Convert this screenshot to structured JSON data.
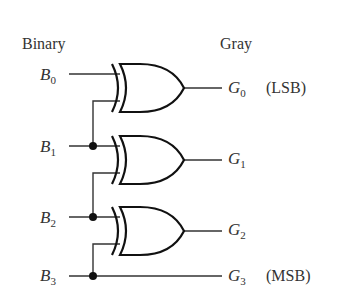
{
  "diagram": {
    "type": "binary-to-gray-code-converter",
    "headers": {
      "left": "Binary",
      "right": "Gray"
    },
    "inputs": [
      {
        "letter": "B",
        "sub": "0"
      },
      {
        "letter": "B",
        "sub": "1"
      },
      {
        "letter": "B",
        "sub": "2"
      },
      {
        "letter": "B",
        "sub": "3"
      }
    ],
    "outputs": [
      {
        "letter": "G",
        "sub": "0",
        "note": "(LSB)"
      },
      {
        "letter": "G",
        "sub": "1",
        "note": ""
      },
      {
        "letter": "G",
        "sub": "2",
        "note": ""
      },
      {
        "letter": "G",
        "sub": "3",
        "note": "(MSB)"
      }
    ],
    "gates": [
      {
        "type": "XOR",
        "inputs": [
          "B0",
          "B1"
        ],
        "output": "G0"
      },
      {
        "type": "XOR",
        "inputs": [
          "B1",
          "B2"
        ],
        "output": "G1"
      },
      {
        "type": "XOR",
        "inputs": [
          "B2",
          "B3"
        ],
        "output": "G2"
      }
    ],
    "passthrough": {
      "input": "B3",
      "output": "G3"
    },
    "colors": {
      "wire": "#333333",
      "gate": "#111111",
      "text": "#333333"
    }
  }
}
